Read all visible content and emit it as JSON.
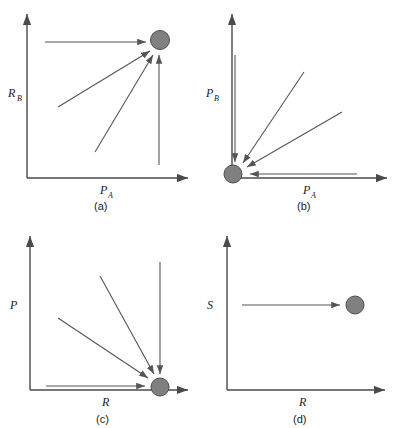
{
  "figure": {
    "type": "multi-panel-diagram",
    "panel_count": 4,
    "layout": "2x2",
    "background_color": "#ffffff"
  },
  "style": {
    "axis_color": "#4a4a4a",
    "arrow_color": "#555555",
    "marker_fill": "#808080",
    "marker_stroke": "#4d4d4d",
    "text_color": "#1a1a1a"
  },
  "panels": [
    {
      "id": "a",
      "caption": "(a)",
      "y_axis_label": "R",
      "y_axis_subscript": "B",
      "x_axis_label": "R",
      "x_axis_subscript": "A",
      "marker_position": "top-right",
      "arrow_count": 4,
      "arrows": [
        {
          "name": "horizontal-from-left",
          "direction": "rightward"
        },
        {
          "name": "diagonal-from-lower-left-shallow",
          "direction": "up-right"
        },
        {
          "name": "diagonal-from-lower-left-steep",
          "direction": "up-right"
        },
        {
          "name": "vertical-from-below",
          "direction": "upward"
        }
      ]
    },
    {
      "id": "b",
      "caption": "(b)",
      "y_axis_label": "P",
      "y_axis_subscript": "B",
      "x_axis_label": "P",
      "x_axis_subscript": "A",
      "marker_position": "origin",
      "arrow_count": 4,
      "arrows": [
        {
          "name": "vertical-from-above",
          "direction": "downward"
        },
        {
          "name": "diagonal-from-upper-right-steep",
          "direction": "down-left"
        },
        {
          "name": "diagonal-from-upper-right-shallow",
          "direction": "down-left"
        },
        {
          "name": "horizontal-from-right",
          "direction": "leftward"
        }
      ]
    },
    {
      "id": "c",
      "caption": "(c)",
      "y_axis_label": "P",
      "y_axis_subscript": "",
      "x_axis_label": "R",
      "x_axis_subscript": "",
      "marker_position": "bottom-right",
      "arrow_count": 4,
      "arrows": [
        {
          "name": "vertical-from-above",
          "direction": "downward"
        },
        {
          "name": "diagonal-from-upper-left-steep",
          "direction": "down-right"
        },
        {
          "name": "diagonal-from-upper-left-shallow",
          "direction": "down-right"
        },
        {
          "name": "horizontal-from-left",
          "direction": "rightward"
        }
      ]
    },
    {
      "id": "d",
      "caption": "(d)",
      "y_axis_label": "S",
      "y_axis_subscript": "",
      "x_axis_label": "R",
      "x_axis_subscript": "",
      "marker_position": "mid-right",
      "arrow_count": 1,
      "arrows": [
        {
          "name": "horizontal-from-left",
          "direction": "rightward"
        }
      ]
    }
  ]
}
